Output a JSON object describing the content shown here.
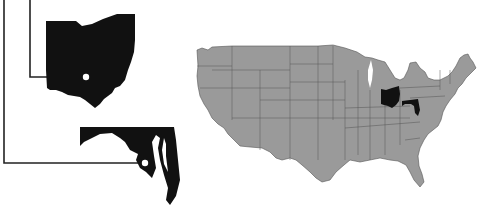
{
  "figure": {
    "type": "locator-map",
    "highlighted_states": [
      {
        "name": "Ohio",
        "inset": true,
        "callout_dot": "capital"
      },
      {
        "name": "Maryland",
        "inset": true,
        "callout_dot": "capital"
      }
    ],
    "colors": {
      "background": "#ffffff",
      "us_fill": "#9a9a9a",
      "state_border": "#4a4a4a",
      "highlight": "#111111",
      "callout_line": "#222222",
      "dot": "#ffffff"
    }
  }
}
